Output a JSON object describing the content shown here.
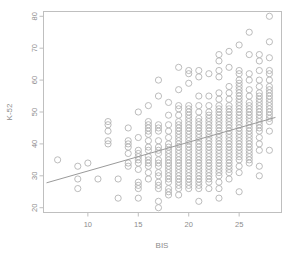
{
  "figure": {
    "background_color": "#ffffff",
    "panel_border_color": "#bfbfbf",
    "point_color": "#b4b4b4",
    "line_color": "#9a9a9a",
    "tick_color": "#bfbfbf",
    "text_color": "#8c8c8c"
  },
  "chart_data": {
    "type": "scatter",
    "title": "",
    "xlabel": "BIS",
    "ylabel": "K-52",
    "xlim": [
      5.6,
      29.2
    ],
    "ylim": [
      18.5,
      81.5
    ],
    "xticks": [
      10,
      15,
      20,
      25
    ],
    "xticklabels": [
      "10",
      "15",
      "20",
      "25"
    ],
    "yticks": [
      20,
      30,
      40,
      50,
      60,
      70,
      80
    ],
    "yticklabels": [
      "20",
      "30",
      "40",
      "50",
      "60",
      "70",
      "80"
    ],
    "grid": false,
    "legend": null,
    "marker": "open-circle",
    "marker_size": 3.1,
    "trendline": {
      "type": "linear-regression",
      "x": [
        5.9,
        28.6
      ],
      "y": [
        27.8,
        48.3
      ]
    },
    "points": [
      [
        7,
        35
      ],
      [
        9,
        33
      ],
      [
        9,
        29
      ],
      [
        9,
        26
      ],
      [
        10,
        34
      ],
      [
        11,
        29
      ],
      [
        12,
        47
      ],
      [
        12,
        46
      ],
      [
        12,
        44
      ],
      [
        12,
        41
      ],
      [
        12,
        40
      ],
      [
        13,
        29
      ],
      [
        13,
        23
      ],
      [
        14,
        45
      ],
      [
        14,
        41
      ],
      [
        14,
        40
      ],
      [
        14,
        39
      ],
      [
        14,
        37
      ],
      [
        14,
        34
      ],
      [
        14,
        33
      ],
      [
        15,
        50
      ],
      [
        15,
        42
      ],
      [
        15,
        38
      ],
      [
        15,
        37
      ],
      [
        15,
        36
      ],
      [
        15,
        35
      ],
      [
        15,
        34
      ],
      [
        15,
        32
      ],
      [
        15,
        28
      ],
      [
        15,
        27
      ],
      [
        15,
        26
      ],
      [
        15,
        23
      ],
      [
        16,
        52
      ],
      [
        16,
        47
      ],
      [
        16,
        46
      ],
      [
        16,
        45
      ],
      [
        16,
        44
      ],
      [
        16,
        43
      ],
      [
        16,
        41
      ],
      [
        16,
        39
      ],
      [
        16,
        38
      ],
      [
        16,
        36
      ],
      [
        16,
        35
      ],
      [
        16,
        34
      ],
      [
        16,
        33
      ],
      [
        16,
        31
      ],
      [
        16,
        29
      ],
      [
        17,
        60
      ],
      [
        17,
        55
      ],
      [
        17,
        46
      ],
      [
        17,
        45
      ],
      [
        17,
        44
      ],
      [
        17,
        41
      ],
      [
        17,
        39
      ],
      [
        17,
        38
      ],
      [
        17,
        37
      ],
      [
        17,
        35
      ],
      [
        17,
        34
      ],
      [
        17,
        33
      ],
      [
        17,
        31
      ],
      [
        17,
        30
      ],
      [
        17,
        28
      ],
      [
        17,
        27
      ],
      [
        17,
        26
      ],
      [
        17,
        22
      ],
      [
        17,
        20
      ],
      [
        18,
        53
      ],
      [
        18,
        49
      ],
      [
        18,
        46
      ],
      [
        18,
        44
      ],
      [
        18,
        42
      ],
      [
        18,
        40
      ],
      [
        18,
        39
      ],
      [
        18,
        38
      ],
      [
        18,
        37
      ],
      [
        18,
        36
      ],
      [
        18,
        35
      ],
      [
        18,
        34
      ],
      [
        18,
        33
      ],
      [
        18,
        32
      ],
      [
        18,
        31
      ],
      [
        18,
        30
      ],
      [
        18,
        29
      ],
      [
        18,
        28
      ],
      [
        18,
        26
      ],
      [
        18,
        25
      ],
      [
        18,
        24
      ],
      [
        19,
        64
      ],
      [
        19,
        57
      ],
      [
        19,
        52
      ],
      [
        19,
        51
      ],
      [
        19,
        49
      ],
      [
        19,
        47
      ],
      [
        19,
        46
      ],
      [
        19,
        45
      ],
      [
        19,
        44
      ],
      [
        19,
        43
      ],
      [
        19,
        42
      ],
      [
        19,
        41
      ],
      [
        19,
        40
      ],
      [
        19,
        39
      ],
      [
        19,
        38
      ],
      [
        19,
        37
      ],
      [
        19,
        36
      ],
      [
        19,
        35
      ],
      [
        19,
        34
      ],
      [
        19,
        33
      ],
      [
        19,
        32
      ],
      [
        19,
        31
      ],
      [
        19,
        30
      ],
      [
        19,
        29
      ],
      [
        19,
        28
      ],
      [
        19,
        27
      ],
      [
        19,
        26
      ],
      [
        19,
        24
      ],
      [
        20,
        63
      ],
      [
        20,
        62
      ],
      [
        20,
        59
      ],
      [
        20,
        52
      ],
      [
        20,
        51
      ],
      [
        20,
        50
      ],
      [
        20,
        49
      ],
      [
        20,
        48
      ],
      [
        20,
        47
      ],
      [
        20,
        46
      ],
      [
        20,
        45
      ],
      [
        20,
        44
      ],
      [
        20,
        43
      ],
      [
        20,
        42
      ],
      [
        20,
        41
      ],
      [
        20,
        40
      ],
      [
        20,
        39
      ],
      [
        20,
        38
      ],
      [
        20,
        37
      ],
      [
        20,
        36
      ],
      [
        20,
        35
      ],
      [
        20,
        34
      ],
      [
        20,
        33
      ],
      [
        20,
        32
      ],
      [
        20,
        31
      ],
      [
        20,
        30
      ],
      [
        20,
        29
      ],
      [
        20,
        28
      ],
      [
        20,
        27
      ],
      [
        20,
        26
      ],
      [
        21,
        63
      ],
      [
        21,
        61
      ],
      [
        21,
        55
      ],
      [
        21,
        52
      ],
      [
        21,
        50
      ],
      [
        21,
        48
      ],
      [
        21,
        47
      ],
      [
        21,
        46
      ],
      [
        21,
        45
      ],
      [
        21,
        44
      ],
      [
        21,
        43
      ],
      [
        21,
        42
      ],
      [
        21,
        41
      ],
      [
        21,
        40
      ],
      [
        21,
        39
      ],
      [
        21,
        38
      ],
      [
        21,
        37
      ],
      [
        21,
        36
      ],
      [
        21,
        35
      ],
      [
        21,
        34
      ],
      [
        21,
        33
      ],
      [
        21,
        32
      ],
      [
        21,
        31
      ],
      [
        21,
        30
      ],
      [
        21,
        29
      ],
      [
        21,
        28
      ],
      [
        21,
        27
      ],
      [
        21,
        26
      ],
      [
        21,
        22
      ],
      [
        22,
        62
      ],
      [
        22,
        55
      ],
      [
        22,
        52
      ],
      [
        22,
        50
      ],
      [
        22,
        49
      ],
      [
        22,
        48
      ],
      [
        22,
        47
      ],
      [
        22,
        46
      ],
      [
        22,
        45
      ],
      [
        22,
        44
      ],
      [
        22,
        43
      ],
      [
        22,
        42
      ],
      [
        22,
        41
      ],
      [
        22,
        40
      ],
      [
        22,
        39
      ],
      [
        22,
        38
      ],
      [
        22,
        37
      ],
      [
        22,
        36
      ],
      [
        22,
        35
      ],
      [
        22,
        34
      ],
      [
        22,
        33
      ],
      [
        22,
        32
      ],
      [
        22,
        31
      ],
      [
        22,
        30
      ],
      [
        22,
        29
      ],
      [
        22,
        28
      ],
      [
        22,
        26
      ],
      [
        23,
        68
      ],
      [
        23,
        66
      ],
      [
        23,
        63
      ],
      [
        23,
        61
      ],
      [
        23,
        56
      ],
      [
        23,
        54
      ],
      [
        23,
        52
      ],
      [
        23,
        51
      ],
      [
        23,
        50
      ],
      [
        23,
        49
      ],
      [
        23,
        48
      ],
      [
        23,
        47
      ],
      [
        23,
        46
      ],
      [
        23,
        45
      ],
      [
        23,
        44
      ],
      [
        23,
        43
      ],
      [
        23,
        42
      ],
      [
        23,
        41
      ],
      [
        23,
        40
      ],
      [
        23,
        39
      ],
      [
        23,
        38
      ],
      [
        23,
        37
      ],
      [
        23,
        36
      ],
      [
        23,
        35
      ],
      [
        23,
        34
      ],
      [
        23,
        33
      ],
      [
        23,
        32
      ],
      [
        23,
        31
      ],
      [
        23,
        30
      ],
      [
        23,
        28
      ],
      [
        23,
        26
      ],
      [
        23,
        23
      ],
      [
        24,
        69
      ],
      [
        24,
        64
      ],
      [
        24,
        58
      ],
      [
        24,
        56
      ],
      [
        24,
        54
      ],
      [
        24,
        52
      ],
      [
        24,
        51
      ],
      [
        24,
        50
      ],
      [
        24,
        49
      ],
      [
        24,
        48
      ],
      [
        24,
        47
      ],
      [
        24,
        46
      ],
      [
        24,
        45
      ],
      [
        24,
        44
      ],
      [
        24,
        43
      ],
      [
        24,
        42
      ],
      [
        24,
        41
      ],
      [
        24,
        40
      ],
      [
        24,
        39
      ],
      [
        24,
        38
      ],
      [
        24,
        37
      ],
      [
        24,
        36
      ],
      [
        24,
        35
      ],
      [
        24,
        34
      ],
      [
        24,
        33
      ],
      [
        24,
        32
      ],
      [
        24,
        31
      ],
      [
        24,
        29
      ],
      [
        25,
        71
      ],
      [
        25,
        63
      ],
      [
        25,
        62
      ],
      [
        25,
        60
      ],
      [
        25,
        59
      ],
      [
        25,
        58
      ],
      [
        25,
        57
      ],
      [
        25,
        56
      ],
      [
        25,
        55
      ],
      [
        25,
        54
      ],
      [
        25,
        53
      ],
      [
        25,
        52
      ],
      [
        25,
        51
      ],
      [
        25,
        50
      ],
      [
        25,
        49
      ],
      [
        25,
        48
      ],
      [
        25,
        47
      ],
      [
        25,
        46
      ],
      [
        25,
        45
      ],
      [
        25,
        44
      ],
      [
        25,
        43
      ],
      [
        25,
        42
      ],
      [
        25,
        41
      ],
      [
        25,
        40
      ],
      [
        25,
        39
      ],
      [
        25,
        38
      ],
      [
        25,
        37
      ],
      [
        25,
        36
      ],
      [
        25,
        35
      ],
      [
        25,
        33
      ],
      [
        25,
        31
      ],
      [
        25,
        25
      ],
      [
        26,
        75
      ],
      [
        26,
        68
      ],
      [
        26,
        62
      ],
      [
        26,
        60
      ],
      [
        26,
        57
      ],
      [
        26,
        55
      ],
      [
        26,
        53
      ],
      [
        26,
        52
      ],
      [
        26,
        51
      ],
      [
        26,
        50
      ],
      [
        26,
        49
      ],
      [
        26,
        48
      ],
      [
        26,
        47
      ],
      [
        26,
        46
      ],
      [
        26,
        45
      ],
      [
        26,
        44
      ],
      [
        26,
        43
      ],
      [
        26,
        42
      ],
      [
        26,
        41
      ],
      [
        26,
        40
      ],
      [
        26,
        39
      ],
      [
        26,
        38
      ],
      [
        26,
        37
      ],
      [
        26,
        36
      ],
      [
        26,
        35
      ],
      [
        26,
        34
      ],
      [
        27,
        68
      ],
      [
        27,
        66
      ],
      [
        27,
        63
      ],
      [
        27,
        60
      ],
      [
        27,
        58
      ],
      [
        27,
        56
      ],
      [
        27,
        55
      ],
      [
        27,
        54
      ],
      [
        27,
        53
      ],
      [
        27,
        52
      ],
      [
        27,
        51
      ],
      [
        27,
        50
      ],
      [
        27,
        49
      ],
      [
        27,
        48
      ],
      [
        27,
        47
      ],
      [
        27,
        46
      ],
      [
        27,
        45
      ],
      [
        27,
        44
      ],
      [
        27,
        42
      ],
      [
        27,
        40
      ],
      [
        27,
        38
      ],
      [
        27,
        33
      ],
      [
        27,
        30
      ],
      [
        28,
        80
      ],
      [
        28,
        72
      ],
      [
        28,
        67
      ],
      [
        28,
        63
      ],
      [
        28,
        62
      ],
      [
        28,
        60
      ],
      [
        28,
        58
      ],
      [
        28,
        57
      ],
      [
        28,
        56
      ],
      [
        28,
        55
      ],
      [
        28,
        54
      ],
      [
        28,
        53
      ],
      [
        28,
        52
      ],
      [
        28,
        51
      ],
      [
        28,
        50
      ],
      [
        28,
        49
      ],
      [
        28,
        48
      ],
      [
        28,
        47
      ],
      [
        28,
        44
      ],
      [
        28,
        38
      ]
    ]
  }
}
